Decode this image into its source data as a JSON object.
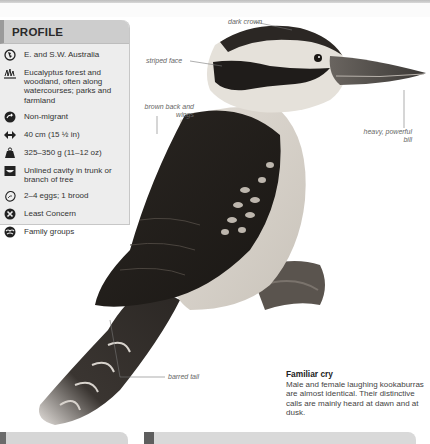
{
  "profile": {
    "title": "PROFILE",
    "items": [
      {
        "icon": "globe-icon",
        "text": "E. and S.W. Australia"
      },
      {
        "icon": "habitat-grass-icon",
        "text": "Eucalyptus forest and woodland, often along watercourses; parks and farmland"
      },
      {
        "icon": "migration-arrow-icon",
        "text": "Non-migrant"
      },
      {
        "icon": "length-arrows-icon",
        "text": "40 cm (15 ½ in)"
      },
      {
        "icon": "weight-icon",
        "text": "325–350 g (11–12 oz)"
      },
      {
        "icon": "nest-icon",
        "text": "Unlined cavity in trunk or branch of tree"
      },
      {
        "icon": "egg-icon",
        "text": "2–4 eggs; 1 brood"
      },
      {
        "icon": "conservation-status-icon",
        "text": "Least Concern"
      },
      {
        "icon": "social-group-icon",
        "text": "Family groups"
      }
    ]
  },
  "annotations": {
    "dark_crown": "dark crown",
    "striped_face": "striped face",
    "brown_back": "brown back and wings",
    "heavy_bill": "heavy, powerful bill",
    "barred_tail": "barred tail"
  },
  "caption": {
    "title": "Familiar cry",
    "body": "Male and female laughing kookaburras are almost identical. Their distinctive calls are mainly heard at dawn and at dusk."
  },
  "colors": {
    "panel_bg": "#ededed",
    "panel_header": "#cdcdcd",
    "accent_bar": "#9a9a9a"
  }
}
